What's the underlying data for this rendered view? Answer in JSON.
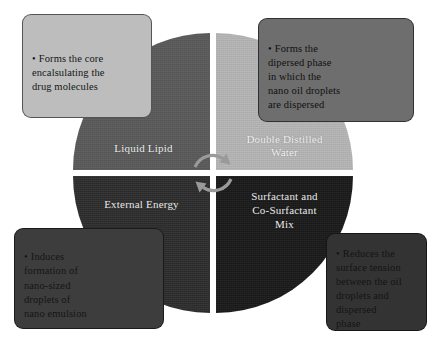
{
  "diagram": {
    "type": "four-quadrant-circle",
    "background_color": "#ffffff",
    "center_icon": "cycle-arrows-icon"
  },
  "circle": {
    "diameter_px": 280,
    "quadrants": [
      {
        "id": "liquid-lipid",
        "position": "top-left",
        "label": "Liquid Lipid",
        "color": "#5a5a5a",
        "text_color": "#f2f2f2"
      },
      {
        "id": "double-distilled-water",
        "position": "top-right",
        "label": "Double Distilled\nWater",
        "color": "#b5b5b5",
        "text_color": "#fbfbfb"
      },
      {
        "id": "external-energy",
        "position": "bottom-left",
        "label": "External Energy",
        "color": "#2d2d2d",
        "text_color": "#f2f2f2"
      },
      {
        "id": "surfactant-mix",
        "position": "bottom-right",
        "label": "Surfactant and\nCo-Surfactant\nMix",
        "color": "#1a1a1a",
        "text_color": "#f2f2f2"
      }
    ]
  },
  "callouts": [
    {
      "id": "liquid-lipid-callout",
      "position": "top-left",
      "bullet": "•",
      "text": "Forms the core\nencalsulating the\ndrug molecules",
      "background_color": "#bdbdbd",
      "text_color": "#161616"
    },
    {
      "id": "double-distilled-water-callout",
      "position": "top-right",
      "bullet": "•",
      "text": "Forms the\ndipersed phase\nin which the\nnano oil droplets\nare dispersed",
      "background_color": "#6e6e6e",
      "text_color": "#101010"
    },
    {
      "id": "external-energy-callout",
      "position": "bottom-left",
      "bullet": "•",
      "text": "Induces\nformation of\nnano-sized\ndroplets of\nnano emulsion",
      "background_color": "#3d3d3d",
      "text_color": "#151515"
    },
    {
      "id": "surfactant-mix-callout",
      "position": "bottom-right",
      "bullet": "•",
      "text": "Reduces the\nsurface tension\nbetween the oil\ndroplets and\ndispersed\nphase",
      "background_color": "#333333",
      "text_color": "#141414"
    }
  ]
}
